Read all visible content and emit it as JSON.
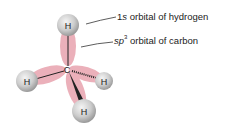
{
  "diagram": {
    "atoms": {
      "center": "C",
      "top": "H",
      "left": "H",
      "right": "H",
      "bottom": "H"
    },
    "labels": {
      "hydrogen_prefix": "1",
      "hydrogen_italic": "s",
      "hydrogen_suffix": " orbital of hydrogen",
      "carbon_italic": "sp",
      "carbon_sup": "3",
      "carbon_suffix": " orbital of carbon"
    },
    "colors": {
      "orbital_lobe": "#e8a3ae",
      "hydrogen_sphere": "#c8c8c8",
      "bond": "#222222"
    }
  }
}
